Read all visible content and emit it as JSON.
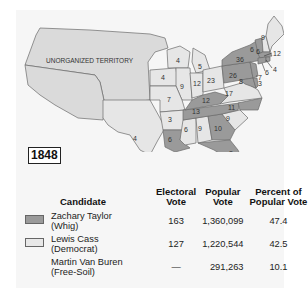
{
  "map": {
    "year": "1848",
    "territory_label": "UNORGANIZED TERRITORY",
    "colors": {
      "whig": "#9a9a9a",
      "democrat": "#e6e6e6",
      "territory": "#dadada",
      "border": "#6a6a6a",
      "background": "#f6f6f6"
    },
    "state_labels": {
      "TX": "4",
      "WI": "4",
      "IA": "4",
      "MI": "5",
      "IL": "9",
      "IN": "12",
      "OH": "23",
      "MO": "7",
      "AR": "3",
      "LA": "6",
      "MS": "6",
      "AL": "9",
      "GA": "10",
      "FL": "3",
      "SC": "9",
      "NC": "11",
      "TN": "13",
      "KY": "12",
      "VA": "17",
      "PA": "26",
      "NY": "36",
      "ME": "9",
      "VT": "6",
      "NH": "6",
      "MA": "12",
      "RI": "4",
      "CT": "6",
      "NJ": "7",
      "DE": "3",
      "MD": "8"
    }
  },
  "table": {
    "headers": {
      "candidate": "Candidate",
      "electoral": [
        "Electoral",
        "Vote"
      ],
      "popular": [
        "Popular",
        "Vote"
      ],
      "percent": [
        "Percent of",
        "Popular Vote"
      ]
    },
    "rows": [
      {
        "name": "Zachary Taylor",
        "party": "(Whig)",
        "swatch": "#9a9a9a",
        "electoral": "163",
        "popular": "1,360,099",
        "percent": "47.4"
      },
      {
        "name": "Lewis Cass",
        "party": "(Democrat)",
        "swatch": "#e8e8e8",
        "electoral": "127",
        "popular": "1,220,544",
        "percent": "42.5"
      },
      {
        "name": "Martin Van Buren",
        "party": "(Free-Soil)",
        "swatch": "",
        "electoral": "—",
        "popular": "291,263",
        "percent": "10.1"
      }
    ]
  }
}
